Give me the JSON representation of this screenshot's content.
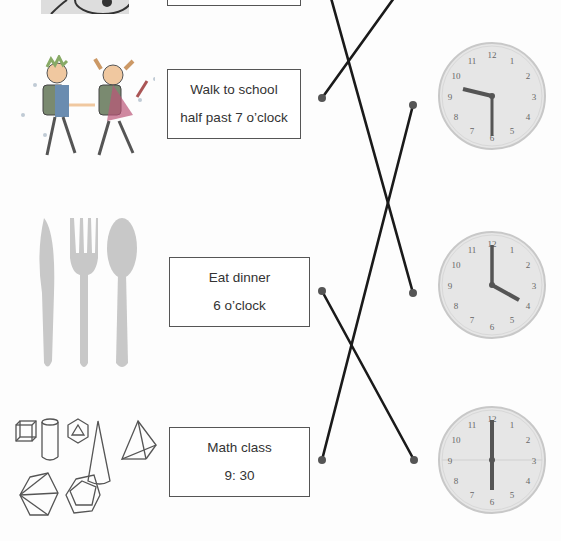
{
  "worksheet": {
    "activities": [
      {
        "id": "top-partial",
        "line1": "",
        "line2": ""
      },
      {
        "id": "walk-to-school",
        "line1": "Walk to school",
        "line2": "half past 7 o’clock",
        "image": "children-walking"
      },
      {
        "id": "eat-dinner",
        "line1": "Eat dinner",
        "line2": "6 o’clock",
        "image": "cutlery"
      },
      {
        "id": "math-class",
        "line1": "Math class",
        "line2": "9: 30",
        "image": "geometric-solids"
      }
    ],
    "clocks": [
      {
        "id": "clock-1",
        "time": "9:30",
        "numbers": [
          "12",
          "1",
          "2",
          "3",
          "4",
          "5",
          "6",
          "7",
          "8",
          "9",
          "10",
          "11"
        ]
      },
      {
        "id": "clock-2",
        "time": "4:00",
        "numbers": [
          "12",
          "1",
          "2",
          "3",
          "4",
          "5",
          "6",
          "7",
          "8",
          "9",
          "10",
          "11"
        ]
      },
      {
        "id": "clock-3",
        "time": "6:00",
        "numbers": [
          "12",
          "1",
          "2",
          "3",
          "4",
          "5",
          "6",
          "7",
          "8",
          "9",
          "10",
          "11"
        ]
      }
    ],
    "colors": {
      "line": "#1a1a1a",
      "dot": "#555555",
      "clock_face": "#e6e6e6",
      "clock_rim": "#c8c8c8",
      "hand": "#555555",
      "cutlery": "#c8c8c8"
    }
  }
}
